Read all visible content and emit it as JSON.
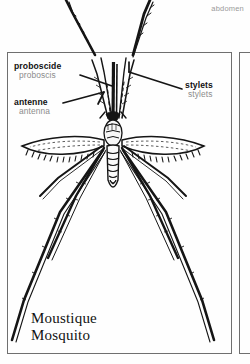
{
  "page": {
    "width": 250,
    "height": 364,
    "background": "#fefefe",
    "ink": "#111111"
  },
  "neighbour_panel": {
    "label": "abdomen",
    "color": "#9a9a9a"
  },
  "frames": {
    "main_panel": "main-illustration-frame",
    "side_panel": "adjacent-panel-frame",
    "border_color": "#6f6f6f"
  },
  "illustration": {
    "subject": "mosquito",
    "style": "black-and-white line engraving",
    "view": "dorsal",
    "features": [
      "segmented abdomen",
      "fringed wings",
      "six long legs",
      "plumed antennae",
      "proboscis with stylets"
    ]
  },
  "labels": [
    {
      "id": "proboscis",
      "fr": "proboscide",
      "en": "proboscis",
      "leader": "line pointing right to the proboscis shaft"
    },
    {
      "id": "antenna",
      "fr": "antenne",
      "en": "antenna",
      "leader": "line pointing right to the antenna base"
    },
    {
      "id": "stylets",
      "fr": "stylets",
      "en": "stylets",
      "leader": "line pointing left to the stylet bundle"
    }
  ],
  "caption": {
    "fr": "Moustique",
    "en": "Mosquito"
  }
}
